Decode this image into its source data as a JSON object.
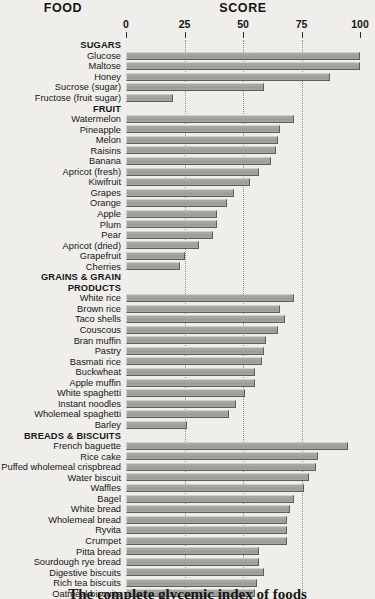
{
  "headers": {
    "food": "FOOD",
    "score": "SCORE"
  },
  "caption": "The complete glycemic index of foods",
  "chart_data": {
    "type": "bar",
    "title": "The complete glycemic index of foods",
    "orientation": "horizontal",
    "xlabel": "SCORE",
    "ylabel": "FOOD",
    "xlim": [
      0,
      100
    ],
    "xticks": [
      0,
      25,
      50,
      75,
      100
    ],
    "xtick_labels": [
      "0",
      "25",
      "50",
      "75",
      "100"
    ],
    "grid": "dotted vertical gridlines at 25, 50, 75",
    "legend": "none",
    "bar_color": "#a3a3a0",
    "bar_border_color": "#5d5d5b",
    "groups": [
      {
        "name": "SUGARS",
        "items": [
          {
            "label": "Glucose",
            "value": 100
          },
          {
            "label": "Maltose",
            "value": 100
          },
          {
            "label": "Honey",
            "value": 87
          },
          {
            "label": "Sucrose (sugar)",
            "value": 59
          },
          {
            "label": "Fructose (fruit sugar)",
            "value": 20
          }
        ]
      },
      {
        "name": "FRUIT",
        "items": [
          {
            "label": "Watermelon",
            "value": 72
          },
          {
            "label": "Pineapple",
            "value": 66
          },
          {
            "label": "Melon",
            "value": 65
          },
          {
            "label": "Raisins",
            "value": 64
          },
          {
            "label": "Banana",
            "value": 62
          },
          {
            "label": "Apricot (fresh)",
            "value": 57
          },
          {
            "label": "Kiwifruit",
            "value": 53
          },
          {
            "label": "Grapes",
            "value": 46
          },
          {
            "label": "Orange",
            "value": 43
          },
          {
            "label": "Apple",
            "value": 39
          },
          {
            "label": "Plum",
            "value": 39
          },
          {
            "label": "Pear",
            "value": 37
          },
          {
            "label": "Apricot (dried)",
            "value": 31
          },
          {
            "label": "Grapefruit",
            "value": 25
          },
          {
            "label": "Cherries",
            "value": 23
          }
        ]
      },
      {
        "name": "GRAINS & GRAIN PRODUCTS",
        "name_line1": "GRAINS & GRAIN",
        "name_line2": "PRODUCTS",
        "items": [
          {
            "label": "White rice",
            "value": 72
          },
          {
            "label": "Brown rice",
            "value": 66
          },
          {
            "label": "Taco shells",
            "value": 68
          },
          {
            "label": "Couscous",
            "value": 65
          },
          {
            "label": "Bran muffin",
            "value": 60
          },
          {
            "label": "Pastry",
            "value": 59
          },
          {
            "label": "Basmati rice",
            "value": 58
          },
          {
            "label": "Buckwheat",
            "value": 55
          },
          {
            "label": "Apple muffin",
            "value": 55
          },
          {
            "label": "White spaghetti",
            "value": 51
          },
          {
            "label": "Instant noodles",
            "value": 47
          },
          {
            "label": "Wholemeal spaghetti",
            "value": 44
          },
          {
            "label": "Barley",
            "value": 26
          }
        ]
      },
      {
        "name": "BREADS & BISCUITS",
        "items": [
          {
            "label": "French baguette",
            "value": 95
          },
          {
            "label": "Rice cake",
            "value": 82
          },
          {
            "label": "Puffed wholemeal crispbread",
            "value": 81
          },
          {
            "label": "Water biscuit",
            "value": 78
          },
          {
            "label": "Waffles",
            "value": 76
          },
          {
            "label": "Bagel",
            "value": 72
          },
          {
            "label": "White bread",
            "value": 70
          },
          {
            "label": "Wholemeal bread",
            "value": 69
          },
          {
            "label": "Ryvita",
            "value": 69
          },
          {
            "label": "Crumpet",
            "value": 69
          },
          {
            "label": "Pitta bread",
            "value": 57
          },
          {
            "label": "Sourdough rye bread",
            "value": 57
          },
          {
            "label": "Digestive biscuits",
            "value": 59
          },
          {
            "label": "Rich tea biscuits",
            "value": 56
          },
          {
            "label": "Oatmeal biscuits",
            "value": 55
          },
          {
            "label": "Wholegrain wheat bread",
            "value": 52
          },
          {
            "label": "Wholegrain rye bread",
            "value": 50
          }
        ]
      }
    ]
  }
}
